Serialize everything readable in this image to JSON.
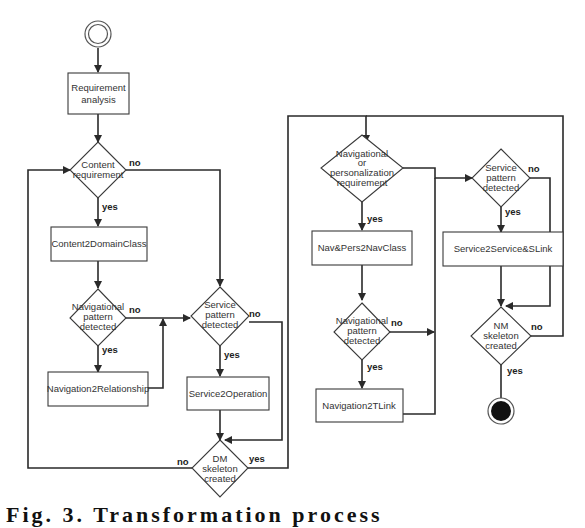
{
  "diagram": {
    "type": "activity-flowchart",
    "start_node": "initial-state",
    "end_node": "final-state",
    "activities": {
      "requirement_analysis": [
        "Requirement",
        "analysis"
      ],
      "content2domainclass": "Content2DomainClass",
      "navigation2relationship": "Navigation2Relationship",
      "service2operation": "Service2Operation",
      "navpers2navclass": "Nav&Pers2NavClass",
      "navigation2tlink": "Navigation2TLink",
      "service2service_slink": "Service2Service&SLink"
    },
    "decisions": {
      "content_requirement": [
        "Content",
        "requirement"
      ],
      "nav_pattern_left": [
        "Navigational",
        "pattern",
        "detected"
      ],
      "service_pattern_left": [
        "Service",
        "pattern",
        "detected"
      ],
      "dm_skeleton": [
        "DM",
        "skeleton",
        "created"
      ],
      "nav_or_pers_requirement": [
        "Navigational",
        "or",
        "personalization",
        "requirement"
      ],
      "nav_pattern_right": [
        "Navigational",
        "pattern",
        "detected"
      ],
      "service_pattern_right": [
        "Service",
        "pattern",
        "detected"
      ],
      "nm_skeleton": [
        "NM",
        "skeleton",
        "created"
      ]
    },
    "branch_labels": {
      "yes": "yes",
      "no": "no"
    }
  },
  "caption": "Fig. 3. Transformation process"
}
